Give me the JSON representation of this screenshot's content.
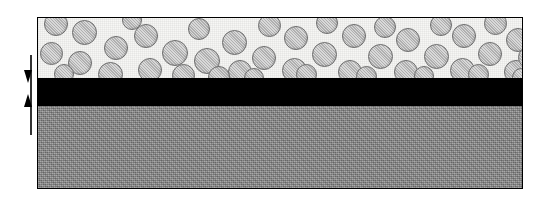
{
  "figure": {
    "type": "cross-section-schematic",
    "background_color": "#ffffff",
    "width": 547,
    "height": 199
  },
  "diagram": {
    "border_color": "#000000",
    "frame": {
      "x": 37,
      "y": 17,
      "width": 486,
      "height": 172
    },
    "layers": [
      {
        "id": "composite-layer",
        "name": "particulate composite layer",
        "fill_color": "#f7f7f5",
        "height_px": 60,
        "texture": "stippled-light",
        "particles": {
          "fill_color": "#b9b9b9",
          "outline_color": "#6e6e6e",
          "shape": "circle",
          "count": 46,
          "diameter_range_px": [
            20,
            27
          ]
        }
      },
      {
        "id": "interlayer",
        "name": "black interlayer",
        "fill_color": "#000000",
        "height_px": 28,
        "texture": "solid"
      },
      {
        "id": "substrate",
        "name": "gray substrate",
        "fill_color": "#8a8a8a",
        "height_px": 84,
        "texture": "stippled-gray"
      }
    ]
  },
  "dimension_marker": {
    "name": "interlayer-thickness-marker",
    "style": "double-arrow-inward",
    "line_color": "#000000",
    "top_arrow": "down-arrowhead",
    "bottom_arrow": "up-arrowhead",
    "label": "",
    "measures_layer": "interlayer"
  },
  "particle_positions": [
    {
      "x": 6,
      "y": -6,
      "d": 24
    },
    {
      "x": 34,
      "y": 2,
      "d": 25
    },
    {
      "x": 66,
      "y": 18,
      "d": 24
    },
    {
      "x": 2,
      "y": 24,
      "d": 23
    },
    {
      "x": 30,
      "y": 33,
      "d": 24
    },
    {
      "x": 60,
      "y": 44,
      "d": 25
    },
    {
      "x": 96,
      "y": 6,
      "d": 24
    },
    {
      "x": 124,
      "y": 22,
      "d": 26
    },
    {
      "x": 100,
      "y": 40,
      "d": 24
    },
    {
      "x": 150,
      "y": 0,
      "d": 22
    },
    {
      "x": 156,
      "y": 30,
      "d": 26
    },
    {
      "x": 134,
      "y": 46,
      "d": 23
    },
    {
      "x": 184,
      "y": 12,
      "d": 25
    },
    {
      "x": 190,
      "y": 42,
      "d": 24
    },
    {
      "x": 214,
      "y": 28,
      "d": 24
    },
    {
      "x": 220,
      "y": -4,
      "d": 23
    },
    {
      "x": 246,
      "y": 8,
      "d": 24
    },
    {
      "x": 244,
      "y": 40,
      "d": 25
    },
    {
      "x": 274,
      "y": 24,
      "d": 25
    },
    {
      "x": 278,
      "y": -6,
      "d": 22
    },
    {
      "x": 304,
      "y": 6,
      "d": 24
    },
    {
      "x": 300,
      "y": 42,
      "d": 24
    },
    {
      "x": 330,
      "y": 26,
      "d": 25
    },
    {
      "x": 336,
      "y": -2,
      "d": 22
    },
    {
      "x": 358,
      "y": 10,
      "d": 24
    },
    {
      "x": 356,
      "y": 42,
      "d": 24
    },
    {
      "x": 386,
      "y": 26,
      "d": 25
    },
    {
      "x": 392,
      "y": -4,
      "d": 22
    },
    {
      "x": 414,
      "y": 6,
      "d": 24
    },
    {
      "x": 412,
      "y": 40,
      "d": 25
    },
    {
      "x": 440,
      "y": 24,
      "d": 24
    },
    {
      "x": 446,
      "y": -6,
      "d": 23
    },
    {
      "x": 468,
      "y": 10,
      "d": 24
    },
    {
      "x": 466,
      "y": 42,
      "d": 24
    },
    {
      "x": 462,
      "y": 34,
      "d": 0
    },
    {
      "x": 84,
      "y": -8,
      "d": 20
    },
    {
      "x": 170,
      "y": 48,
      "d": 22
    },
    {
      "x": 258,
      "y": 46,
      "d": 21
    },
    {
      "x": 318,
      "y": 48,
      "d": 21
    },
    {
      "x": 430,
      "y": 46,
      "d": 21
    },
    {
      "x": 206,
      "y": 50,
      "d": 20
    },
    {
      "x": 16,
      "y": 46,
      "d": 20
    },
    {
      "x": 376,
      "y": 48,
      "d": 20
    },
    {
      "x": 480,
      "y": 28,
      "d": 23
    },
    {
      "x": 488,
      "y": 0,
      "d": 21
    },
    {
      "x": 474,
      "y": 50,
      "d": 19
    }
  ]
}
